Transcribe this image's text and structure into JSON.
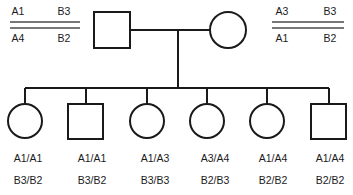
{
  "diagram": {
    "type": "pedigree-chart",
    "generations": 2
  },
  "haplotypes": {
    "father": {
      "side": "left",
      "top_row": [
        "A1",
        "B3"
      ],
      "bottom_row": [
        "A4",
        "B2"
      ]
    },
    "mother": {
      "side": "right",
      "top_row": [
        "A3",
        "B3"
      ],
      "bottom_row": [
        "A1",
        "B2"
      ]
    }
  },
  "parents": [
    {
      "id": "father",
      "symbol": "square",
      "sex": "male",
      "cx": 112,
      "cy": 30
    },
    {
      "id": "mother",
      "symbol": "circle",
      "sex": "female",
      "cx": 228,
      "cy": 30
    }
  ],
  "offspring": [
    {
      "index": 1,
      "symbol": "circle",
      "sex": "female",
      "cx": 25,
      "locus_a": "A1/A1",
      "locus_b": "B3/B2"
    },
    {
      "index": 2,
      "symbol": "square",
      "sex": "male",
      "cx": 86,
      "locus_a": "A1/A1",
      "locus_b": "B3/B2"
    },
    {
      "index": 3,
      "symbol": "circle",
      "sex": "female",
      "cx": 147,
      "locus_a": "A1/A3",
      "locus_b": "B3/B3"
    },
    {
      "index": 4,
      "symbol": "circle",
      "sex": "female",
      "cx": 207,
      "locus_a": "A3/A4",
      "locus_b": "B2/B3"
    },
    {
      "index": 5,
      "symbol": "circle",
      "sex": "female",
      "cx": 267,
      "locus_a": "A1/A4",
      "locus_b": "B2/B2"
    },
    {
      "index": 6,
      "symbol": "square",
      "sex": "male",
      "cx": 329,
      "locus_a": "A1/A4",
      "locus_b": "B2/B2"
    }
  ],
  "colors": {
    "line": "#1a1a1a",
    "symbol_fill": "#ffffff",
    "text": "#1a1a1a",
    "haplotype_bar": "#4a4a4a"
  }
}
